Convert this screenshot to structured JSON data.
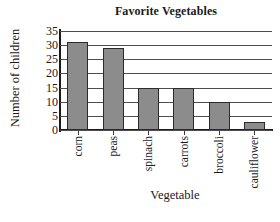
{
  "chart_data": {
    "type": "bar",
    "title": "Favorite Vegetables",
    "xlabel": "Vegetable",
    "ylabel": "Number of children",
    "categories": [
      "corn",
      "peas",
      "spinach",
      "carrots",
      "broccoli",
      "cauliflower"
    ],
    "values": [
      31,
      29,
      15,
      15,
      10,
      3
    ],
    "ylim": [
      0,
      35
    ],
    "ytick_labels": [
      "0",
      "5",
      "10",
      "15",
      "20",
      "25",
      "30",
      "35"
    ],
    "ytick_values": [
      0,
      5,
      10,
      15,
      20,
      25,
      30,
      35
    ],
    "grid": true,
    "legend": "none",
    "bar_color": "#8c8c8c",
    "bar_edge_color": "#2b2b2b",
    "axis_color": "#1a1a1a",
    "grid_color": "#4d4d4d",
    "background_color": "#ffffff"
  }
}
